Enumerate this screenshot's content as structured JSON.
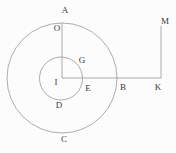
{
  "figure": {
    "labels": {
      "a": "A",
      "o": "O",
      "g": "G",
      "i": "I",
      "e": "E",
      "b": "B",
      "k": "K",
      "m": "M",
      "d": "D",
      "c": "C"
    }
  },
  "colors": {
    "background": "#fcfcfc",
    "line": "#96918c",
    "label": "#3b3b3b"
  }
}
